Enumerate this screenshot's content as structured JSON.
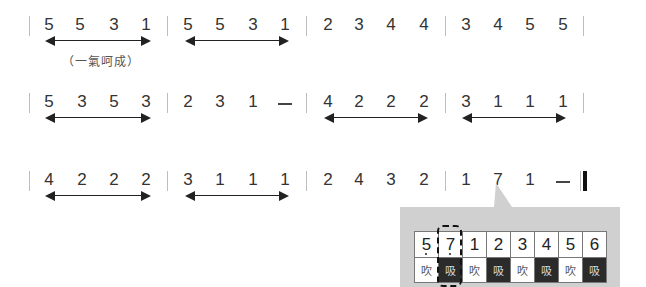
{
  "rows": [
    {
      "measures": [
        {
          "notes": [
            "5",
            "5",
            "3",
            "1"
          ]
        },
        {
          "notes": [
            "5",
            "5",
            "3",
            "1"
          ]
        },
        {
          "notes": [
            "2",
            "3",
            "4",
            "4"
          ]
        },
        {
          "notes": [
            "3",
            "4",
            "5",
            "5"
          ]
        }
      ],
      "arrows_under_measures": [
        0,
        1
      ],
      "annotation": "（一氣呵成）"
    },
    {
      "measures": [
        {
          "notes": [
            "5",
            "3",
            "5",
            "3"
          ]
        },
        {
          "notes": [
            "2",
            "3",
            "1",
            "—"
          ]
        },
        {
          "notes": [
            "4",
            "2",
            "2",
            "2"
          ]
        },
        {
          "notes": [
            "3",
            "1",
            "1",
            "1"
          ]
        }
      ],
      "arrows_under_measures": [
        0,
        2,
        3
      ]
    },
    {
      "measures": [
        {
          "notes": [
            "4",
            "2",
            "2",
            "2"
          ]
        },
        {
          "notes": [
            "3",
            "1",
            "1",
            "1"
          ]
        },
        {
          "notes": [
            "2",
            "4",
            "3",
            "2"
          ]
        },
        {
          "notes": [
            "1",
            "7",
            "1",
            "—"
          ],
          "low_octave_index": 1
        }
      ],
      "arrows_under_measures": [
        0,
        1
      ],
      "final_barline": true
    }
  ],
  "callout": {
    "keys": [
      {
        "note": "5",
        "low_octave": true,
        "breath": "吹",
        "type": "blow"
      },
      {
        "note": "7",
        "low_octave": true,
        "breath": "吸",
        "type": "draw",
        "highlighted": true
      },
      {
        "note": "1",
        "low_octave": false,
        "breath": "吹",
        "type": "blow"
      },
      {
        "note": "2",
        "low_octave": false,
        "breath": "吸",
        "type": "draw"
      },
      {
        "note": "3",
        "low_octave": false,
        "breath": "吹",
        "type": "blow"
      },
      {
        "note": "4",
        "low_octave": false,
        "breath": "吸",
        "type": "draw"
      },
      {
        "note": "5",
        "low_octave": false,
        "breath": "吹",
        "type": "blow"
      },
      {
        "note": "6",
        "low_octave": false,
        "breath": "吸",
        "type": "draw"
      }
    ]
  },
  "colors": {
    "barline": "#bdbdbd",
    "callout_bg": "#d0d0d0",
    "draw_cell": "#2b2b2b",
    "blow_cell": "#ffffff"
  }
}
